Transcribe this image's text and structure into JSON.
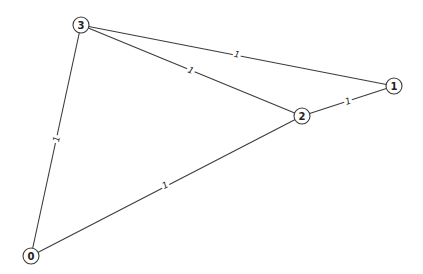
{
  "graph": {
    "nodes": [
      {
        "id": "0",
        "label": "0",
        "x": 31,
        "y": 256
      },
      {
        "id": "1",
        "label": "1",
        "x": 394,
        "y": 86
      },
      {
        "id": "2",
        "label": "2",
        "x": 302,
        "y": 116
      },
      {
        "id": "3",
        "label": "3",
        "x": 81,
        "y": 25
      }
    ],
    "edges": [
      {
        "source": "3",
        "target": "1",
        "label": "1",
        "lx": 237,
        "ly": 54
      },
      {
        "source": "3",
        "target": "2",
        "label": "1",
        "lx": 191,
        "ly": 70
      },
      {
        "source": "2",
        "target": "1",
        "label": "1",
        "lx": 348,
        "ly": 101
      },
      {
        "source": "3",
        "target": "0",
        "label": "1",
        "lx": 56,
        "ly": 139
      },
      {
        "source": "0",
        "target": "2",
        "label": "1",
        "lx": 165,
        "ly": 185
      }
    ],
    "node_radius": 8,
    "colors": {
      "edge": "#3c3c3c",
      "node_stroke": "#3a3a3a",
      "node_fill": "#ffffff",
      "text": "#222222",
      "background": "#ffffff"
    }
  }
}
